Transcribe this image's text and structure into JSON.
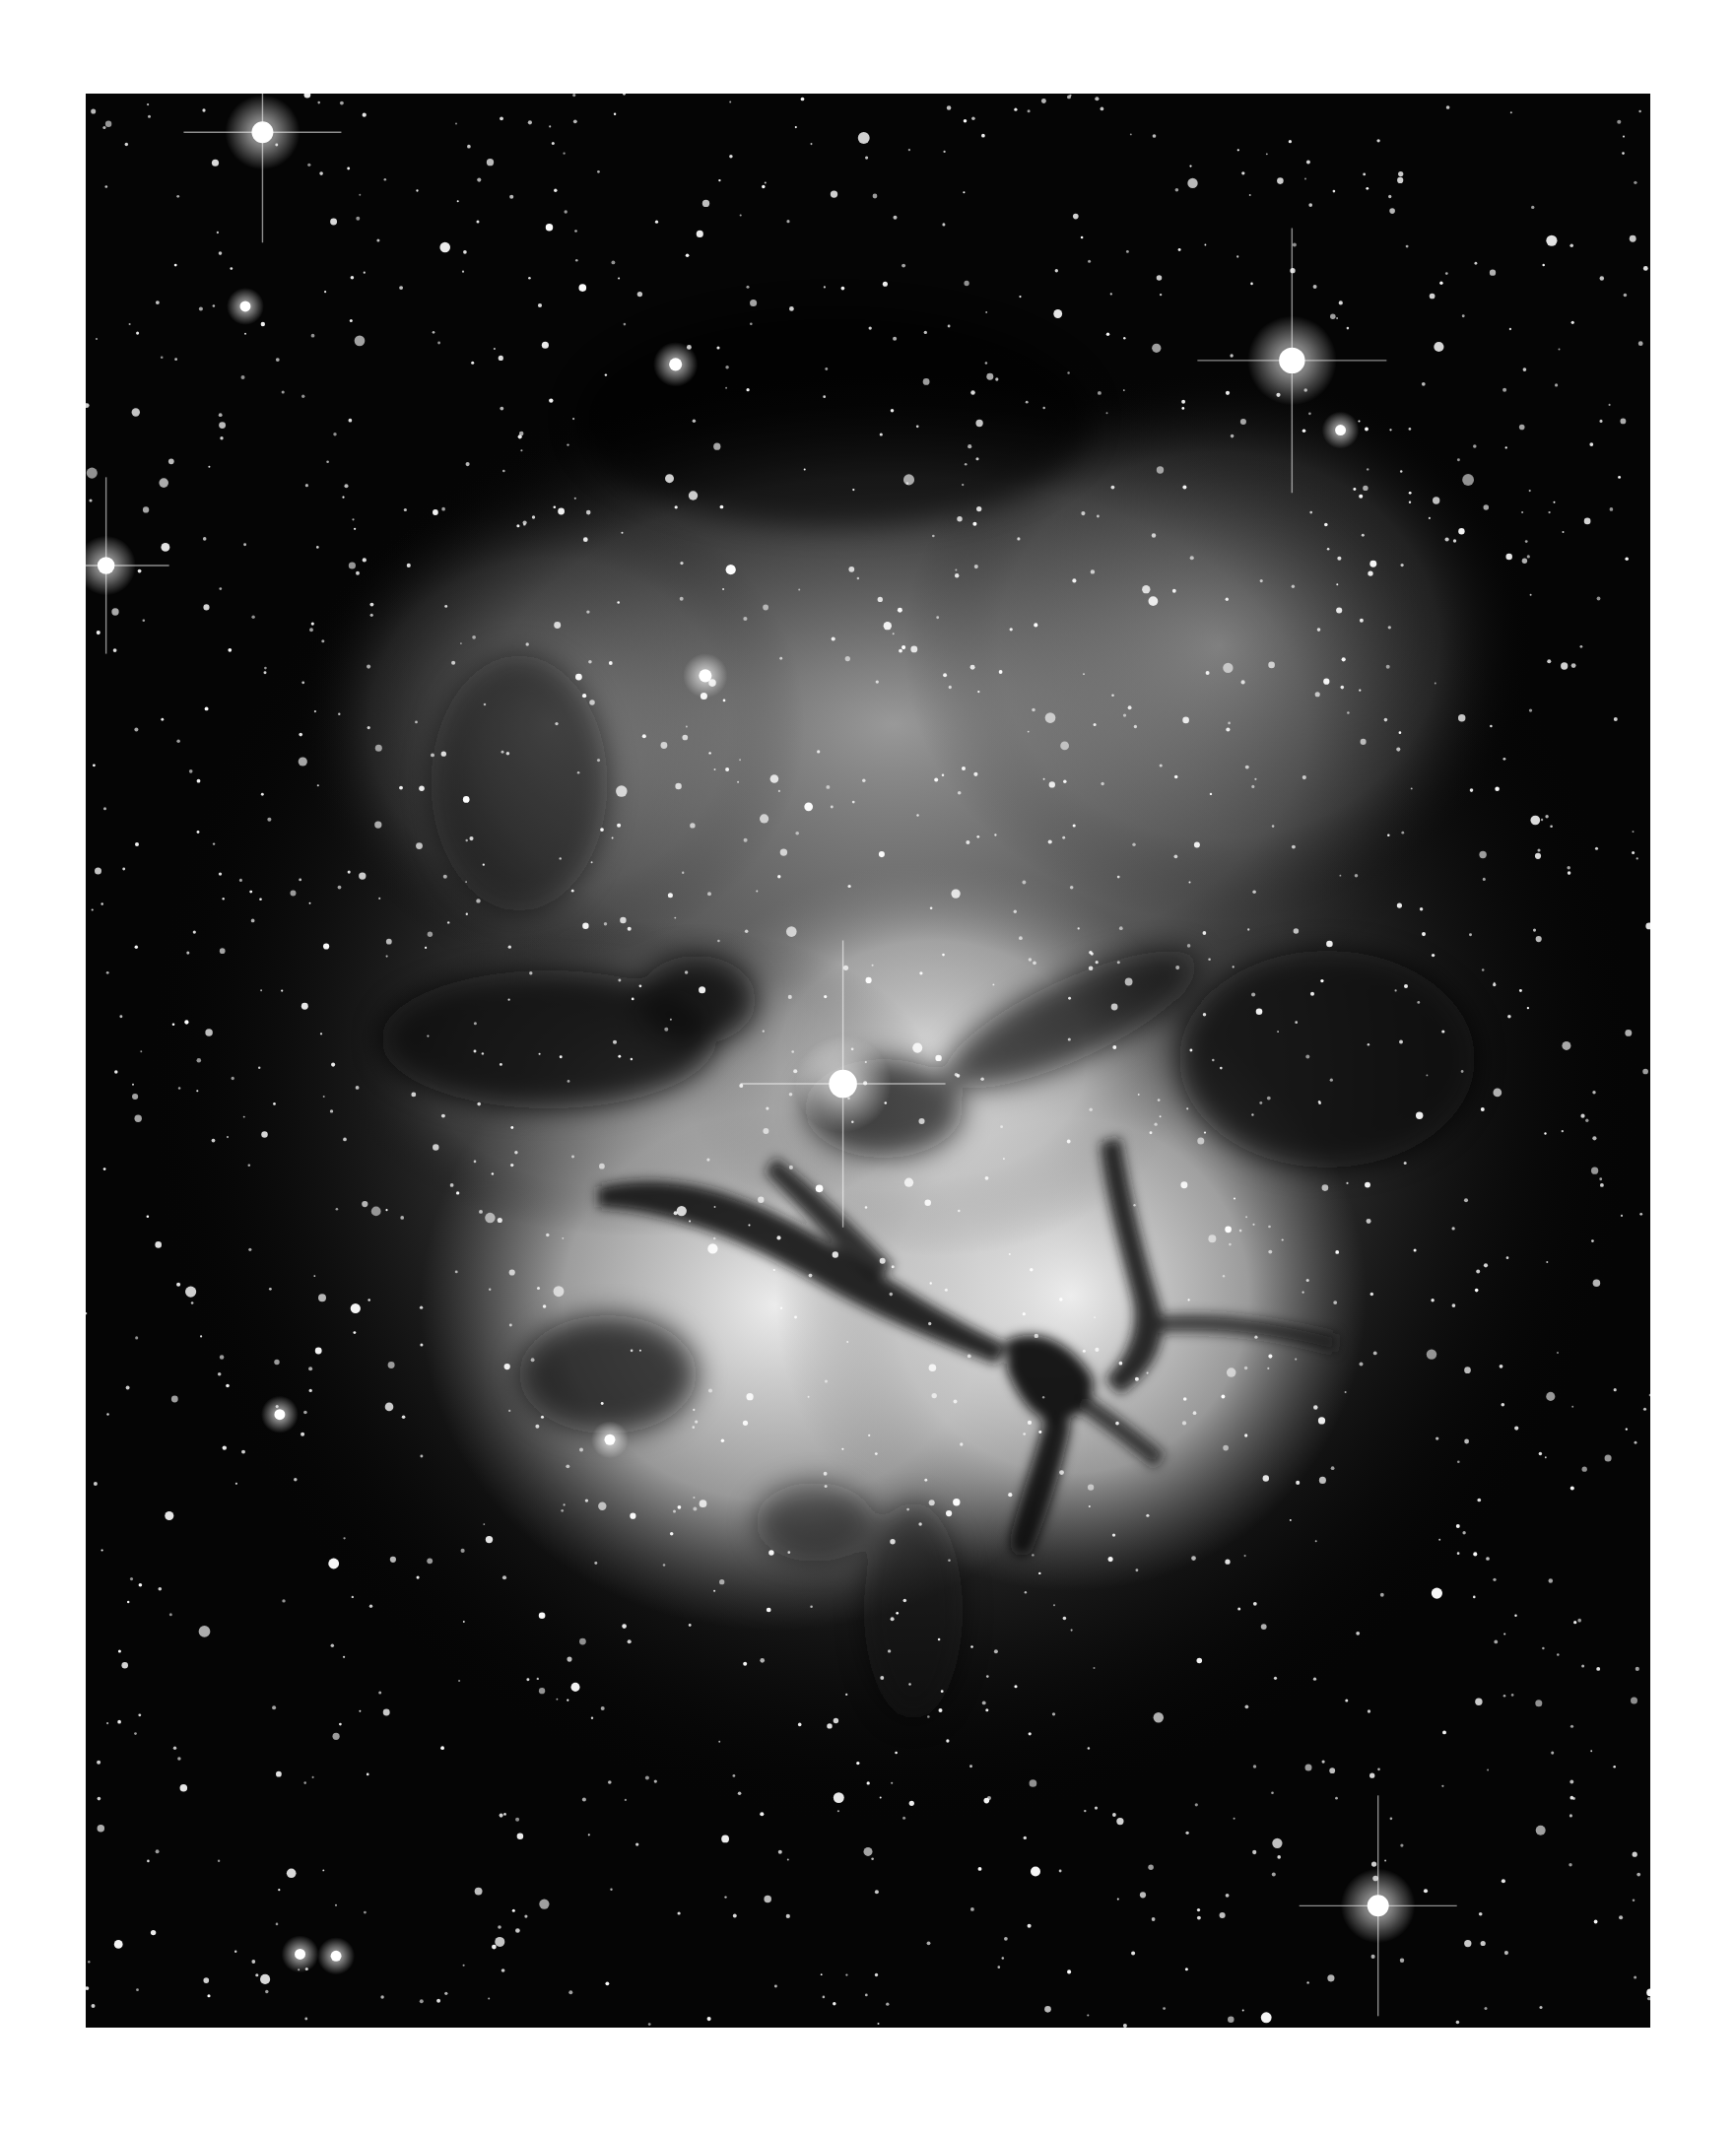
{
  "image": {
    "subject": "Trifid Nebula (M20)",
    "alt": "Black and white astronomical photograph of the Trifid Nebula with dark dust lanes radiating from a bright central star, surrounded by a dense star field",
    "palette": {
      "background_page": "#ffffff",
      "sky": "#050505",
      "nebula_glow": "#d8d8d8",
      "nebula_core": "#f2f2f2",
      "dust_lane": "#1a1a1a",
      "star": "#ffffff"
    },
    "bright_stars": [
      {
        "name": "bright-star-top-left",
        "u": 0.113,
        "v": 0.02,
        "mag": 1.0
      },
      {
        "name": "bright-star-top-right",
        "u": 0.771,
        "v": 0.138,
        "mag": 1.2
      },
      {
        "name": "bright-star-left-edge",
        "u": 0.013,
        "v": 0.244,
        "mag": 0.8
      },
      {
        "name": "bright-star-upper-center",
        "u": 0.377,
        "v": 0.14,
        "mag": 0.6
      },
      {
        "name": "bright-star-nebula-top",
        "u": 0.396,
        "v": 0.301,
        "mag": 0.6
      },
      {
        "name": "bright-star-bottom-right",
        "u": 0.826,
        "v": 0.937,
        "mag": 1.0
      },
      {
        "name": "central-star-trifid",
        "u": 0.484,
        "v": 0.512,
        "mag": 1.3
      },
      {
        "name": "bright-star-right-top",
        "u": 0.802,
        "v": 0.174,
        "mag": 0.5
      },
      {
        "name": "bright-star-left-mid",
        "u": 0.102,
        "v": 0.11,
        "mag": 0.5
      },
      {
        "name": "bright-star-lower-left",
        "u": 0.124,
        "v": 0.683,
        "mag": 0.5
      },
      {
        "name": "bright-star-lower-mid",
        "u": 0.335,
        "v": 0.696,
        "mag": 0.5
      },
      {
        "name": "bright-star-bottom-left-pair-a",
        "u": 0.137,
        "v": 0.962,
        "mag": 0.5
      },
      {
        "name": "bright-star-bottom-left-pair-b",
        "u": 0.16,
        "v": 0.963,
        "mag": 0.5
      }
    ],
    "field_star_count": 1400,
    "field_star_seed": 20
  }
}
